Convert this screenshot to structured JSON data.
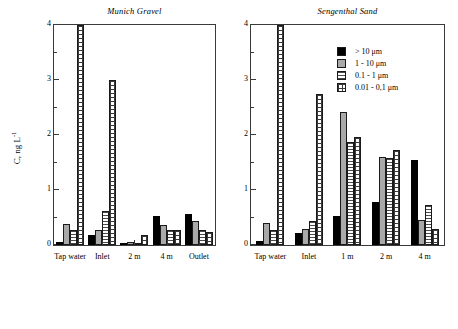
{
  "figure": {
    "ylabel_text": "C, ng L",
    "ylabel_exponent": "-1"
  },
  "legend": {
    "position": "top-right-inside-right-panel",
    "entries": [
      {
        "label": "> 10 μm",
        "series": "s0"
      },
      {
        "label": "1 - 10 μm",
        "series": "s1"
      },
      {
        "label": "0.1 - 1 μm",
        "series": "s2"
      },
      {
        "label": "0.01 - 0,1 μm",
        "series": "s3"
      }
    ]
  },
  "chart_data": [
    {
      "type": "bar",
      "panel_id": "munich-gravel",
      "title": "Munich Gravel",
      "xlabel": "",
      "ylabel": "C, ng L-1",
      "ylim": [
        0,
        4
      ],
      "yticks": [
        0,
        1,
        2,
        3,
        4
      ],
      "ytick_labels": [
        "0",
        "1",
        "2",
        "3",
        "4"
      ],
      "yminor": [
        0.5,
        1.5,
        2.5,
        3.5
      ],
      "grid": false,
      "categories": [
        "Tap water",
        "Inlet",
        "2 m",
        "4 m",
        "Outlet"
      ],
      "series": [
        {
          "name": "> 10 μm",
          "values": [
            0.06,
            0.18,
            0.04,
            0.52,
            0.56
          ]
        },
        {
          "name": "1 - 10 μm",
          "values": [
            0.38,
            0.28,
            0.05,
            0.36,
            0.44
          ]
        },
        {
          "name": "0.1 - 1 μm",
          "values": [
            0.27,
            0.62,
            0.03,
            0.28,
            0.28
          ]
        },
        {
          "name": "0.01 - 0,1 μm",
          "values": [
            4.0,
            3.0,
            0.19,
            0.28,
            0.24
          ]
        }
      ]
    },
    {
      "type": "bar",
      "panel_id": "sengenthal-sand",
      "title": "Sengenthal Sand",
      "xlabel": "",
      "ylabel": "C, ng L-1",
      "ylim": [
        0,
        4
      ],
      "yticks": [
        0,
        1,
        2,
        3,
        4
      ],
      "ytick_labels": [
        "0",
        "1",
        "2",
        "3",
        "4"
      ],
      "yminor": [
        0.5,
        1.5,
        2.5,
        3.5
      ],
      "grid": false,
      "categories": [
        "Tap water",
        "Inlet",
        "1 m",
        "2 m",
        "4 m"
      ],
      "series": [
        {
          "name": "> 10 μm",
          "values": [
            0.07,
            0.22,
            0.52,
            0.78,
            1.55
          ]
        },
        {
          "name": "1 - 10 μm",
          "values": [
            0.4,
            0.3,
            2.42,
            1.6,
            0.45
          ]
        },
        {
          "name": "0.1 - 1 μm",
          "values": [
            0.28,
            0.44,
            1.88,
            1.58,
            0.72
          ]
        },
        {
          "name": "0.01 - 0,1 μm",
          "values": [
            4.0,
            2.75,
            1.97,
            1.72,
            0.3
          ]
        }
      ]
    }
  ]
}
